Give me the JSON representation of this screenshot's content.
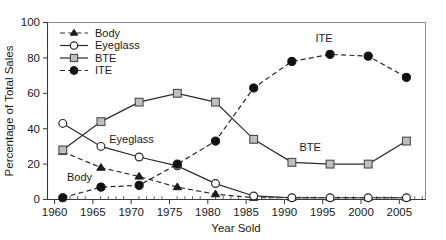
{
  "chart_data": {
    "type": "line",
    "title": "",
    "xlabel": "Year Sold",
    "ylabel": "Percentage of Total Sales",
    "x": [
      1960,
      1965,
      1970,
      1975,
      1980,
      1985,
      1990,
      1995,
      2000,
      2005
    ],
    "xlim": [
      1958,
      2007.5
    ],
    "ylim": [
      0,
      100
    ],
    "xticks": [
      "1960",
      "1965",
      "1970",
      "1975",
      "1980",
      "1985",
      "1990",
      "1995",
      "2000",
      "2005"
    ],
    "yticks": [
      "0",
      "20",
      "40",
      "60",
      "80",
      "100"
    ],
    "grid": false,
    "legend_position": "upper-left-inside",
    "series": [
      {
        "name": "Body",
        "marker": "filled-triangle",
        "linestyle": "dashed",
        "color": "#1c1c1c",
        "values": [
          27,
          18,
          13,
          7,
          3,
          1,
          1,
          1,
          1,
          1
        ]
      },
      {
        "name": "Eyeglass",
        "marker": "open-circle",
        "linestyle": "solid",
        "color": "#2b2b2b",
        "values": [
          43,
          30,
          24,
          19,
          9,
          2,
          1,
          1,
          1,
          1
        ]
      },
      {
        "name": "BTE",
        "marker": "gray-square",
        "linestyle": "solid",
        "color": "#4a4a4a",
        "values": [
          28,
          44,
          55,
          60,
          55,
          34,
          21,
          20,
          20,
          33
        ]
      },
      {
        "name": "ITE",
        "marker": "filled-circle",
        "linestyle": "dashed",
        "color": "#111111",
        "values": [
          1,
          7,
          8,
          20,
          33,
          63,
          78,
          82,
          81,
          69
        ]
      }
    ],
    "annotations": [
      {
        "text": "Body",
        "x": 1962.2,
        "y": 10.5
      },
      {
        "text": "Eyeglass",
        "x": 1969.0,
        "y": 32.0
      },
      {
        "text": "BTE",
        "x": 1992.4,
        "y": 27.5
      },
      {
        "text": "ITE",
        "x": 1994.2,
        "y": 89.0
      }
    ]
  },
  "legend": {
    "entries": [
      {
        "label": "Body",
        "marker": "filled-triangle",
        "linestyle": "dashed"
      },
      {
        "label": "Eyeglass",
        "marker": "open-circle",
        "linestyle": "solid"
      },
      {
        "label": "BTE",
        "marker": "gray-square",
        "linestyle": "solid"
      },
      {
        "label": "ITE",
        "marker": "filled-circle",
        "linestyle": "dashed"
      }
    ]
  }
}
